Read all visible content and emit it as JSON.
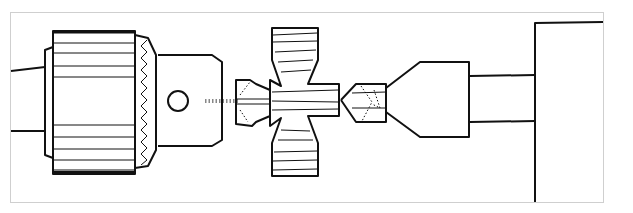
{
  "figure": {
    "components": [
      {
        "id": "spindle",
        "label": ""
      },
      {
        "id": "drill-chuck",
        "label": ""
      },
      {
        "id": "drive-centre",
        "label": ""
      },
      {
        "id": "workpiece",
        "label": ""
      },
      {
        "id": "live-centre",
        "label": ""
      },
      {
        "id": "tailstock",
        "label": ""
      }
    ],
    "colors": {
      "line": "#111111",
      "frame": "#cccccc",
      "background": "#ffffff"
    }
  }
}
